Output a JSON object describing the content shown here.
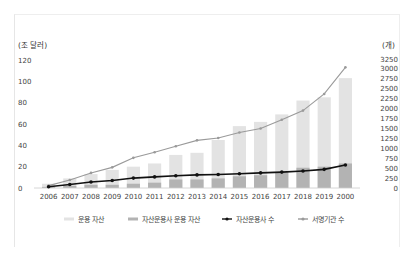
{
  "chart_data": {
    "type": "bar",
    "title": "",
    "ylabel": "(조 달러)",
    "y2label": "(개)",
    "ylim": [
      0,
      120
    ],
    "y2lim": [
      0,
      3250
    ],
    "yticks": [
      0,
      20,
      40,
      60,
      80,
      100,
      120
    ],
    "y2ticks": [
      0,
      250,
      500,
      750,
      1000,
      1250,
      1500,
      1750,
      2000,
      2250,
      2500,
      2750,
      3000,
      3250
    ],
    "categories": [
      "2006",
      "2007",
      "2008",
      "2009",
      "2010",
      "2011",
      "2012",
      "2013",
      "2014",
      "2015",
      "2016",
      "2017",
      "2018",
      "2019",
      "2000"
    ],
    "series": [
      {
        "name": "운용 자산",
        "type": "bar",
        "axis": "left",
        "color": "#e3e3e3",
        "values": [
          4,
          9,
          13,
          17,
          20,
          23,
          31,
          33,
          45,
          58,
          62,
          69,
          82,
          85,
          103
        ]
      },
      {
        "name": "자산운용사 운용 자산",
        "type": "bar",
        "axis": "left",
        "color": "#b3b3b3",
        "values": [
          1,
          2,
          3,
          3,
          4,
          5,
          8,
          8,
          9,
          11,
          12,
          15,
          19,
          20,
          23
        ]
      },
      {
        "name": "자산운용사 수",
        "type": "line",
        "axis": "right",
        "color": "#111111",
        "values": [
          30,
          90,
          150,
          190,
          250,
          280,
          310,
          330,
          340,
          360,
          380,
          400,
          430,
          470,
          580
        ]
      },
      {
        "name": "서명기관 수",
        "type": "line",
        "axis": "right",
        "color": "#9a9a9a",
        "values": [
          60,
          200,
          380,
          520,
          760,
          900,
          1050,
          1200,
          1260,
          1400,
          1500,
          1720,
          1950,
          2370,
          3040
        ]
      }
    ],
    "grid": false,
    "legend_position": "bottom"
  }
}
